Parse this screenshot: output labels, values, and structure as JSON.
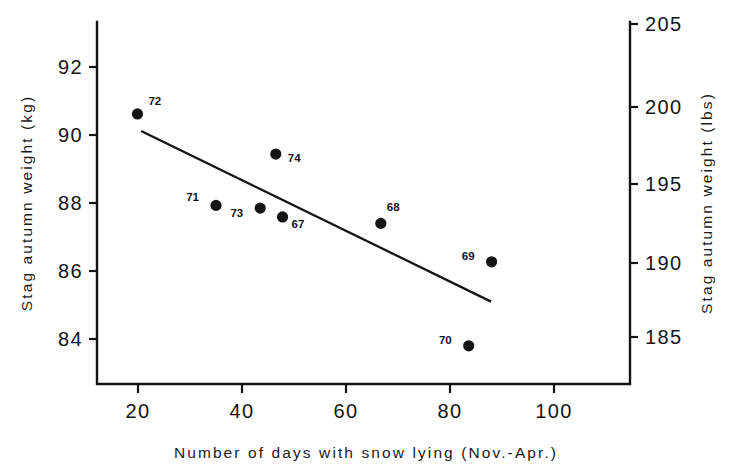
{
  "chart_data": {
    "type": "scatter",
    "title": "",
    "xlabel": "Number of days with snow lying (Nov.-Apr.)",
    "ylabel": "Stag autumn weight (kg)",
    "ylabel_right": "Stag autumn weight (lbs)",
    "xlim": [
      10,
      108
    ],
    "ylim_left": [
      82.9,
      93.1
    ],
    "ylim_right": [
      182.8,
      205.3
    ],
    "xticks": [
      20,
      40,
      60,
      80,
      100
    ],
    "xticklabels": [
      "20",
      "40",
      "60",
      "80",
      "100"
    ],
    "yticks_left": [
      84,
      86,
      88,
      90,
      92
    ],
    "yticklabels_left": [
      "84",
      "86",
      "88",
      "90",
      "92"
    ],
    "yticks_right": [
      185,
      190,
      195,
      200,
      205
    ],
    "yticklabels_right": [
      "185",
      "190",
      "195",
      "200",
      "205"
    ],
    "grid": false,
    "legend": "none",
    "point_label_key": "year",
    "points": [
      {
        "label": "72",
        "x": 19.9,
        "y": 90.62,
        "label_dx": 11,
        "label_dy": -9
      },
      {
        "label": "74",
        "x": 46.5,
        "y": 89.44,
        "label_dx": 12,
        "label_dy": 8
      },
      {
        "label": "71",
        "x": 35.0,
        "y": 87.93,
        "label_dx": -17,
        "label_dy": -4
      },
      {
        "label": "73",
        "x": 43.5,
        "y": 87.85,
        "label_dx": -17,
        "label_dy": 9
      },
      {
        "label": "67",
        "x": 47.8,
        "y": 87.59,
        "label_dx": 9,
        "label_dy": 11
      },
      {
        "label": "68",
        "x": 66.7,
        "y": 87.4,
        "label_dx": 6,
        "label_dy": -12
      },
      {
        "label": "69",
        "x": 88.0,
        "y": 86.27,
        "label_dx": -17,
        "label_dy": -2
      },
      {
        "label": "70",
        "x": 83.6,
        "y": 83.8,
        "label_dx": -17,
        "label_dy": -2
      }
    ],
    "fit_line": {
      "name": "regression-line",
      "x_start": 20.6,
      "y_start": 90.12,
      "x_end": 87.9,
      "y_end": 85.1
    }
  }
}
